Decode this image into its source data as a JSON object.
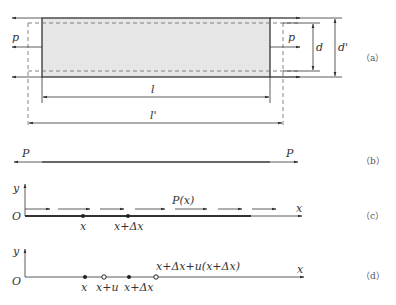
{
  "figure": {
    "panels": [
      {
        "id": "a",
        "caption": "（a）",
        "labels": {
          "force_left": "p",
          "force_right": "p",
          "width_original": "d",
          "width_deformed": "d'",
          "length_original": "l",
          "length_deformed": "l'"
        }
      },
      {
        "id": "b",
        "caption": "（b）",
        "labels": {
          "force_left": "P",
          "force_right": "P"
        }
      },
      {
        "id": "c",
        "caption": "（c）",
        "labels": {
          "y_axis": "y",
          "x_axis": "x",
          "origin": "O",
          "distributed_force": "P(x)",
          "point_x": "x",
          "point_x_dx": "x+Δx"
        }
      },
      {
        "id": "d",
        "caption": "（d）",
        "labels": {
          "y_axis": "y",
          "x_axis": "x",
          "origin": "O",
          "point_x": "x",
          "point_x_u": "x+u",
          "point_x_dx": "x+Δx",
          "point_x_dx_u": "x+Δx+u(x+Δx)"
        }
      }
    ],
    "colors": {
      "line": "#333333",
      "fill": "#e6e6e6",
      "dashed": "#666666"
    }
  }
}
